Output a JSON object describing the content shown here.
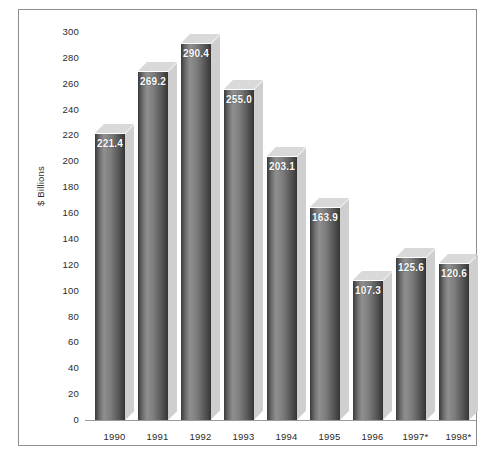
{
  "chart_data": {
    "type": "bar",
    "title": "",
    "subtitle": "",
    "xlabel": "",
    "ylabel": "$ Billions",
    "ylim": [
      0,
      300
    ],
    "ytick_step": 20,
    "grid": false,
    "legend": "none",
    "value_labels_inside_bars": true,
    "style": "3d-shaded-bars",
    "categories": [
      "1990",
      "1991",
      "1992",
      "1993",
      "1994",
      "1995",
      "1996",
      "1997*",
      "1998*"
    ],
    "values": [
      221.4,
      269.2,
      290.4,
      255.0,
      203.1,
      163.9,
      107.3,
      125.6,
      120.6
    ],
    "value_labels": [
      "221.4",
      "269.2",
      "290.4",
      "255.0",
      "203.1",
      "163.9",
      "107.3",
      "125.6",
      "120.6"
    ],
    "ytick_labels": [
      "300",
      "280",
      "260",
      "240",
      "220",
      "200",
      "180",
      "160",
      "140",
      "120",
      "100",
      "80",
      "60",
      "40",
      "20",
      "0"
    ],
    "ytick_values": [
      300,
      280,
      260,
      240,
      220,
      200,
      180,
      160,
      140,
      120,
      100,
      80,
      60,
      40,
      20,
      0
    ],
    "footnote": "* denotes estimated/projected years",
    "colors": {
      "bar_dark": "#3a3a3a",
      "bar_light": "#8f8f8f",
      "bar_side": "#cfcfcf",
      "bar_top": "#d9d9d9",
      "frame": "#8e8e8e",
      "text": "#2b2b2b",
      "label_text": "#ffffff",
      "background": "#ffffff"
    }
  }
}
